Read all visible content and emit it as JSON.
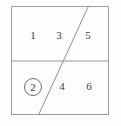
{
  "diagram": {
    "type": "rectangle-partition",
    "title": "",
    "frame": {
      "x": 11,
      "y": 6,
      "width": 98,
      "height": 109,
      "stroke_color": "#9a9a9a",
      "background_color": "#fdfdfd"
    },
    "lines": [
      {
        "name": "horizontal-divider",
        "x1": 11,
        "y1": 61,
        "x2": 109,
        "y2": 61,
        "stroke_color": "#9a9a9a"
      },
      {
        "name": "diagonal-divider",
        "x1": 88,
        "y1": 6,
        "x2": 39,
        "y2": 115,
        "stroke_color": "#8f8f8f"
      }
    ],
    "regions": [
      {
        "id": "region-1",
        "label": "1",
        "x": 33,
        "y": 36,
        "circled": false,
        "row": "top"
      },
      {
        "id": "region-3",
        "label": "3",
        "x": 59,
        "y": 36,
        "circled": false,
        "row": "top"
      },
      {
        "id": "region-5",
        "label": "5",
        "x": 88,
        "y": 36,
        "circled": false,
        "row": "top"
      },
      {
        "id": "region-2",
        "label": "2",
        "x": 33,
        "y": 87,
        "circled": true,
        "row": "bottom"
      },
      {
        "id": "region-4",
        "label": "4",
        "x": 62,
        "y": 87,
        "circled": false,
        "row": "bottom"
      },
      {
        "id": "region-6",
        "label": "6",
        "x": 89,
        "y": 87,
        "circled": false,
        "row": "bottom"
      }
    ],
    "colors": {
      "stroke": "#9a9a9a",
      "text": "#3b3b3b",
      "circle_stroke": "#6e6e6e",
      "background": "#fdfdfd"
    }
  }
}
